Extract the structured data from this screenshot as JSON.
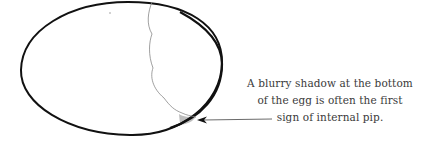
{
  "figure": {
    "subject": "egg",
    "annotation": {
      "lines": [
        "A blurry shadow at the bottom",
        "of the egg is often the first",
        "sign of internal pip."
      ]
    },
    "colors": {
      "outline": "#111111",
      "crack": "#888888",
      "shadow": "#bdbdbd",
      "arrow": "#444444",
      "text": "#3a3a3a"
    }
  }
}
